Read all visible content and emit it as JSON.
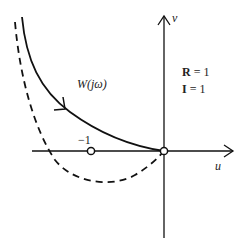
{
  "diagram": {
    "type": "nyquist-plot",
    "axes": {
      "x_label": "u",
      "y_label": "v"
    },
    "curves": [
      {
        "name": "W(jω)",
        "style": "solid",
        "label": "W(jω)"
      },
      {
        "name": "shifted",
        "style": "dashed"
      }
    ],
    "points": [
      {
        "label": "−1",
        "u": -1,
        "v": 0
      },
      {
        "label": "",
        "u": 0,
        "v": 0
      }
    ],
    "annotations": [
      {
        "text": "R = 1",
        "bold_part": "R",
        "rest": " = 1"
      },
      {
        "text": "I = 1",
        "bold_part": "I",
        "rest": " = 1"
      }
    ],
    "colors": {
      "line": "#111111",
      "background": "#ffffff"
    }
  }
}
